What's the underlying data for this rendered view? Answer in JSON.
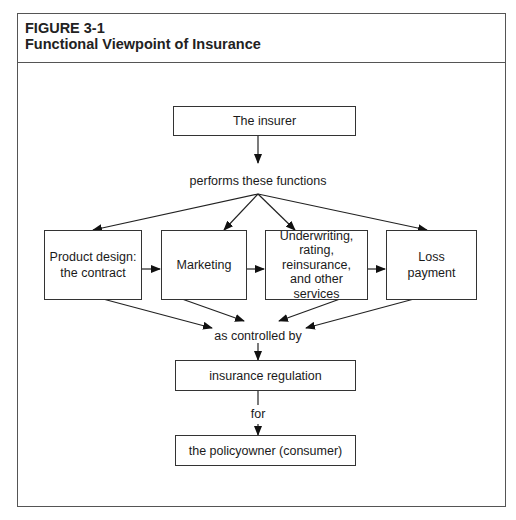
{
  "figure": {
    "number": "FIGURE 3-1",
    "title": "Functional Viewpoint of Insurance"
  },
  "diagram": {
    "top_box": "The insurer",
    "connector_1": "performs  these functions",
    "functions": [
      {
        "label": "Product design:\nthe contract"
      },
      {
        "label": "Marketing"
      },
      {
        "label": "Underwriting,\nrating,\nreinsurance,\nand other services"
      },
      {
        "label": "Loss\npayment"
      }
    ],
    "connector_2": "as controlled by",
    "regulation_box": "insurance regulation",
    "connector_3": "for",
    "bottom_box": "the policyowner (consumer)"
  }
}
